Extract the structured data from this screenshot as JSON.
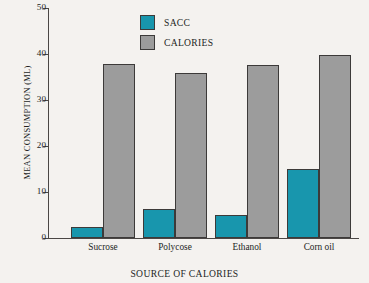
{
  "chart_data": {
    "type": "bar",
    "title": "",
    "xlabel": "SOURCE OF CALORIES",
    "ylabel": "MEAN CONSUMPTION (ML)",
    "categories": [
      "Sucrose",
      "Polycose",
      "Ethanol",
      "Corn oil"
    ],
    "series": [
      {
        "name": "SACC",
        "color": "#1896ad",
        "values": [
          2.5,
          6.3,
          5.0,
          15.0
        ]
      },
      {
        "name": "CALORIES",
        "color": "#9c9c9c",
        "values": [
          37.8,
          35.8,
          37.6,
          39.7
        ]
      }
    ],
    "ylim": [
      0,
      50
    ],
    "yticks": [
      0,
      10,
      20,
      30,
      40,
      50
    ],
    "grid": false,
    "legend_position": "top-left-inside"
  },
  "legend": {
    "items": [
      {
        "label": "SACC",
        "color": "#1896ad"
      },
      {
        "label": "CALORIES",
        "color": "#9c9c9c"
      }
    ]
  },
  "axes": {
    "y_title": "MEAN CONSUMPTION (ML)",
    "x_title": "SOURCE OF CALORIES",
    "y_ticks": [
      "50",
      "40",
      "30",
      "20",
      "10",
      "0"
    ]
  },
  "colors": {
    "sacc": "#1896ad",
    "calories": "#9c9c9c",
    "axis": "#4b4745",
    "background": "#f4f2ef",
    "bar_outline": "#3c3a39"
  }
}
